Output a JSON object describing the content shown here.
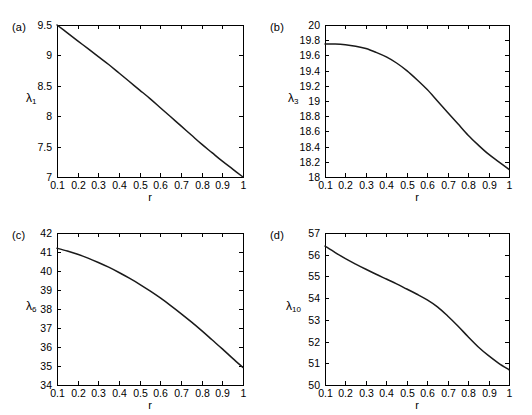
{
  "figure": {
    "background": "#ffffff",
    "curve_color": "#1a1a1a",
    "axis_color": "#000000",
    "panel_count": 4
  },
  "chart_data": [
    {
      "type": "line",
      "panel_tag": "(a)",
      "title": "",
      "xlabel": "r",
      "ylabel": "λ",
      "ylabel_sub": "1",
      "xlim": [
        0.1,
        1
      ],
      "ylim": [
        7,
        9.5
      ],
      "xticks": [
        0.1,
        0.2,
        0.3,
        0.4,
        0.5,
        0.6,
        0.7,
        0.8,
        0.9,
        1
      ],
      "xtick_labels": [
        "0.1",
        "0.2",
        "0.3",
        "0.4",
        "0.5",
        "0.6",
        "0.7",
        "0.8",
        "0.9",
        "1"
      ],
      "yticks": [
        7,
        7.5,
        8,
        8.5,
        9,
        9.5
      ],
      "ytick_labels": [
        "7",
        "7.5",
        "8",
        "8.5",
        "9",
        "9.5"
      ],
      "grid": false,
      "legend": null,
      "x": [
        0.1,
        0.15,
        0.2,
        0.25,
        0.3,
        0.35,
        0.4,
        0.45,
        0.5,
        0.55,
        0.6,
        0.65,
        0.7,
        0.75,
        0.8,
        0.85,
        0.9,
        0.95,
        1.0
      ],
      "values": [
        9.5,
        9.37,
        9.24,
        9.11,
        8.98,
        8.85,
        8.71,
        8.57,
        8.43,
        8.29,
        8.14,
        7.99,
        7.84,
        7.69,
        7.54,
        7.4,
        7.26,
        7.13,
        7.0
      ]
    },
    {
      "type": "line",
      "panel_tag": "(b)",
      "title": "",
      "xlabel": "r",
      "ylabel": "λ",
      "ylabel_sub": "3",
      "xlim": [
        0.1,
        1
      ],
      "ylim": [
        18,
        20
      ],
      "xticks": [
        0.1,
        0.2,
        0.3,
        0.4,
        0.5,
        0.6,
        0.7,
        0.8,
        0.9,
        1
      ],
      "xtick_labels": [
        "0.1",
        "0.2",
        "0.3",
        "0.4",
        "0.5",
        "0.6",
        "0.7",
        "0.8",
        "0.9",
        "1"
      ],
      "yticks": [
        18,
        18.2,
        18.4,
        18.6,
        18.8,
        19,
        19.2,
        19.4,
        19.6,
        19.8,
        20
      ],
      "ytick_labels": [
        "18",
        "18.2",
        "18.4",
        "18.6",
        "18.8",
        "19",
        "19.2",
        "19.4",
        "19.6",
        "19.8",
        "20"
      ],
      "grid": false,
      "legend": null,
      "x": [
        0.1,
        0.15,
        0.2,
        0.25,
        0.3,
        0.35,
        0.4,
        0.45,
        0.5,
        0.55,
        0.6,
        0.65,
        0.7,
        0.75,
        0.8,
        0.85,
        0.9,
        0.95,
        1.0
      ],
      "values": [
        19.75,
        19.75,
        19.74,
        19.72,
        19.69,
        19.64,
        19.58,
        19.5,
        19.4,
        19.28,
        19.15,
        19.0,
        18.85,
        18.7,
        18.55,
        18.42,
        18.3,
        18.2,
        18.1
      ]
    },
    {
      "type": "line",
      "panel_tag": "(c)",
      "title": "",
      "xlabel": "r",
      "ylabel": "λ",
      "ylabel_sub": "6",
      "xlim": [
        0.1,
        1
      ],
      "ylim": [
        34,
        42
      ],
      "xticks": [
        0.1,
        0.2,
        0.3,
        0.4,
        0.5,
        0.6,
        0.7,
        0.8,
        0.9,
        1
      ],
      "xtick_labels": [
        "0.1",
        "0.2",
        "0.3",
        "0.4",
        "0.5",
        "0.6",
        "0.7",
        "0.8",
        "0.9",
        "1"
      ],
      "yticks": [
        34,
        35,
        36,
        37,
        38,
        39,
        40,
        41,
        42
      ],
      "ytick_labels": [
        "34",
        "35",
        "36",
        "37",
        "38",
        "39",
        "40",
        "41",
        "42"
      ],
      "grid": false,
      "legend": null,
      "x": [
        0.1,
        0.15,
        0.2,
        0.25,
        0.3,
        0.35,
        0.4,
        0.45,
        0.5,
        0.55,
        0.6,
        0.65,
        0.7,
        0.75,
        0.8,
        0.85,
        0.9,
        0.95,
        1.0
      ],
      "values": [
        41.2,
        41.05,
        40.88,
        40.68,
        40.45,
        40.2,
        39.92,
        39.62,
        39.3,
        38.95,
        38.58,
        38.18,
        37.76,
        37.32,
        36.86,
        36.38,
        35.9,
        35.4,
        34.92
      ]
    },
    {
      "type": "line",
      "panel_tag": "(d)",
      "title": "",
      "xlabel": "r",
      "ylabel": "λ",
      "ylabel_sub": "10",
      "xlim": [
        0.1,
        1
      ],
      "ylim": [
        50,
        57
      ],
      "xticks": [
        0.1,
        0.2,
        0.3,
        0.4,
        0.5,
        0.6,
        0.7,
        0.8,
        0.9,
        1
      ],
      "xtick_labels": [
        "0.1",
        "0.2",
        "0.3",
        "0.4",
        "0.5",
        "0.6",
        "0.7",
        "0.8",
        "0.9",
        "1"
      ],
      "yticks": [
        50,
        51,
        52,
        53,
        54,
        55,
        56,
        57
      ],
      "ytick_labels": [
        "50",
        "51",
        "52",
        "53",
        "54",
        "55",
        "56",
        "57"
      ],
      "grid": false,
      "legend": null,
      "x": [
        0.1,
        0.15,
        0.2,
        0.25,
        0.3,
        0.35,
        0.4,
        0.45,
        0.5,
        0.55,
        0.6,
        0.65,
        0.7,
        0.75,
        0.8,
        0.85,
        0.9,
        0.95,
        1.0
      ],
      "values": [
        56.4,
        56.1,
        55.82,
        55.57,
        55.33,
        55.1,
        54.88,
        54.66,
        54.42,
        54.18,
        53.92,
        53.6,
        53.18,
        52.72,
        52.22,
        51.75,
        51.35,
        51.0,
        50.7
      ]
    }
  ]
}
